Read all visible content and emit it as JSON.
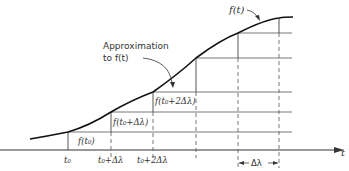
{
  "diagram": {
    "curve_label": "f(t)",
    "approx_label_line1": "Approximation",
    "approx_label_line2": "to f(t)",
    "step_labels": [
      "f(t₀)",
      "f(t₀+Δλ)",
      "f(t₀+2Δλ)"
    ],
    "axis_label": "t",
    "tick_labels": [
      "t₀",
      "t₀+Δλ",
      "t₀+2Δλ"
    ],
    "interval_label": "Δλ",
    "colors": {
      "line": "#222222",
      "grid": "#555555",
      "background": "#ffffff"
    }
  }
}
